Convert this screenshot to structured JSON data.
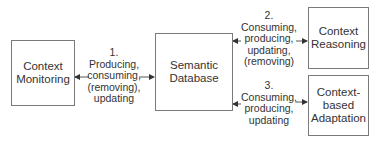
{
  "nodes": {
    "monitoring": {
      "line1": "Context",
      "line2": "Monitoring"
    },
    "database": {
      "line1": "Semantic",
      "line2": "Database"
    },
    "reasoning": {
      "line1": "Context",
      "line2": "Reasoning"
    },
    "adaptation": {
      "line1": "Context-",
      "line2": "based",
      "line3": "Adaptation"
    }
  },
  "edges": {
    "e1": {
      "num": "1.",
      "l1": "Producing,",
      "l2": "consuming,",
      "l3": "(removing),",
      "l4": "updating"
    },
    "e2": {
      "num": "2.",
      "l1": "Consuming,",
      "l2": "producing,",
      "l3": "updating,",
      "l4": "(removing)"
    },
    "e3": {
      "num": "3.",
      "l1": "Consuming,",
      "l2": "producing,",
      "l3": "updating"
    }
  }
}
